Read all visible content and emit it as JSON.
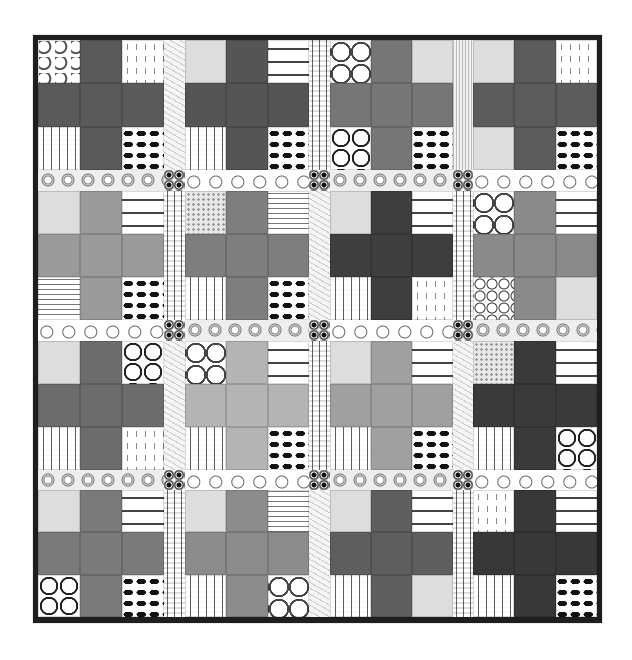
{
  "image": {
    "subject": "quilt",
    "description": "Grayscale plus-sign (cross) patchwork quilt, 4x4 blocks with pieced sashing and dark binding",
    "colors": {
      "binding": "#1e1e1e",
      "background": "#ffffff"
    },
    "grid": {
      "rows": 4,
      "cols": 4
    },
    "blocks": [
      [
        {
          "cross": "#5a5a5a",
          "corners": [
            "p-swirl",
            "p-vine",
            "p-dots",
            "p-leaf"
          ]
        },
        {
          "cross": "#555555",
          "corners": [
            "p-zigzag",
            "p-script",
            "p-dots",
            "p-leaf"
          ]
        },
        {
          "cross": "#767676",
          "corners": [
            "p-quatre",
            "p-floral",
            "p-circles",
            "p-leaf"
          ]
        },
        {
          "cross": "#5c5c5c",
          "corners": [
            "p-floral",
            "p-vine",
            "p-floral",
            "p-leaf"
          ]
        }
      ],
      [
        {
          "cross": "#9a9a9a",
          "corners": [
            "p-floral",
            "p-script",
            "p-music",
            "p-leaf"
          ]
        },
        {
          "cross": "#7e7e7e",
          "corners": [
            "p-speckle",
            "p-music",
            "p-dots",
            "p-leaf"
          ]
        },
        {
          "cross": "#3e3e3e",
          "corners": [
            "p-floral",
            "p-script",
            "p-dots",
            "p-vine"
          ]
        },
        {
          "cross": "#8a8a8a",
          "corners": [
            "p-quatre",
            "p-script",
            "p-paisley",
            "p-floral"
          ]
        }
      ],
      [
        {
          "cross": "#6c6c6c",
          "corners": [
            "p-floral",
            "p-circles",
            "p-dots",
            "p-vine"
          ]
        },
        {
          "cross": "#b4b4b4",
          "corners": [
            "p-quatre",
            "p-script",
            "p-dots",
            "p-leaf"
          ]
        },
        {
          "cross": "#a0a0a0",
          "corners": [
            "p-floral",
            "p-script",
            "p-dots",
            "p-leaf"
          ]
        },
        {
          "cross": "#3a3a3a",
          "corners": [
            "p-speckle",
            "p-script",
            "p-dots",
            "p-circles"
          ]
        }
      ],
      [
        {
          "cross": "#7a7a7a",
          "corners": [
            "p-floral",
            "p-script",
            "p-circles",
            "p-leaf"
          ]
        },
        {
          "cross": "#8c8c8c",
          "corners": [
            "p-floral",
            "p-music",
            "p-dots",
            "p-quatre"
          ]
        },
        {
          "cross": "#5e5e5e",
          "corners": [
            "p-floral",
            "p-script",
            "p-dots",
            "p-zigzag"
          ]
        },
        {
          "cross": "#383838",
          "corners": [
            "p-vine",
            "p-script",
            "p-dots",
            "p-leaf"
          ]
        }
      ]
    ],
    "vertical_sashing": [
      [
        "sash-v-feather",
        "sash-v-dots",
        "sash-v-stripe"
      ],
      [
        "sash-v-dots",
        "sash-v-feather",
        "sash-v-dots"
      ],
      [
        "sash-v-feather",
        "sash-v-dots",
        "sash-v-feather"
      ],
      [
        "sash-v-dots",
        "sash-v-feather",
        "sash-v-dots"
      ]
    ],
    "horizontal_sashing": [
      [
        "sash-h-medallion",
        "sash-h-swirl",
        "sash-h-medallion",
        "sash-h-swirl"
      ],
      [
        "sash-h-swirl",
        "sash-h-medallion",
        "sash-h-swirl",
        "sash-h-medallion"
      ],
      [
        "sash-h-medallion",
        "sash-h-swirl",
        "sash-h-medallion",
        "sash-h-swirl"
      ]
    ],
    "cornerstone_pattern": "corner"
  }
}
